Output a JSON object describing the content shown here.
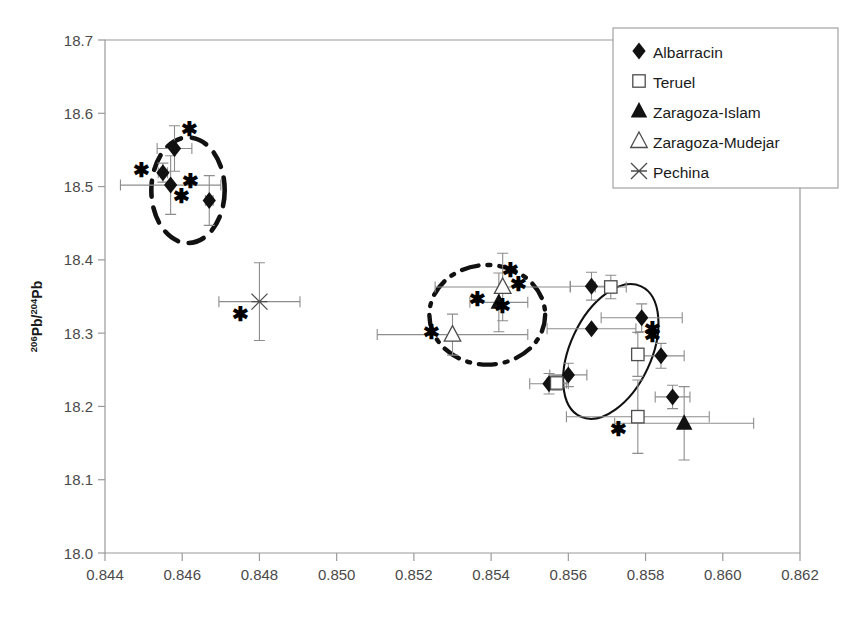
{
  "chart_data": {
    "type": "scatter",
    "title": "",
    "xlabel": "",
    "ylabel": "206Pb/204Pb",
    "ylabel_parts": {
      "sup1": "206",
      "mid": "Pb/",
      "sup2": "204",
      "tail": "Pb"
    },
    "xlim": [
      0.844,
      0.862
    ],
    "ylim": [
      18.0,
      18.7
    ],
    "xticks": [
      "0.844",
      "0.846",
      "0.848",
      "0.850",
      "0.852",
      "0.854",
      "0.856",
      "0.858",
      "0.860",
      "0.862"
    ],
    "xtick_values": [
      0.844,
      0.846,
      0.848,
      0.85,
      0.852,
      0.854,
      0.856,
      0.858,
      0.86,
      0.862
    ],
    "yticks": [
      "18.0",
      "18.1",
      "18.2",
      "18.3",
      "18.4",
      "18.5",
      "18.6",
      "18.7"
    ],
    "ytick_values": [
      18.0,
      18.1,
      18.2,
      18.3,
      18.4,
      18.5,
      18.6,
      18.7
    ],
    "grid": false,
    "legend_position": "top-right",
    "legend": [
      {
        "label": "Albarracin",
        "marker": "filled-diamond"
      },
      {
        "label": "Teruel",
        "marker": "open-square"
      },
      {
        "label": "Zaragoza-Islam",
        "marker": "filled-triangle"
      },
      {
        "label": "Zaragoza-Mudejar",
        "marker": "open-triangle"
      },
      {
        "label": "Pechina",
        "marker": "x-cross"
      }
    ],
    "series": [
      {
        "name": "Albarracin",
        "marker": "filled-diamond",
        "points": [
          {
            "x": 0.8458,
            "y": 18.552,
            "xerr": 0.00045,
            "yerr": 0.031,
            "star": "upper-right"
          },
          {
            "x": 0.8455,
            "y": 18.519,
            "xerr": 0.00012,
            "yerr": 0.013,
            "star": "left"
          },
          {
            "x": 0.8457,
            "y": 18.502,
            "xerr": 0.0013,
            "yerr": 0.04,
            "star": "lower-right"
          },
          {
            "x": 0.8467,
            "y": 18.481,
            "xerr": 0.0001,
            "yerr": 0.034,
            "star": "upper-left"
          },
          {
            "x": 0.8566,
            "y": 18.364,
            "xerr": 0.00055,
            "yerr": 0.019,
            "star": "none"
          },
          {
            "x": 0.8579,
            "y": 18.321,
            "xerr": 0.00105,
            "yerr": 0.019,
            "star": "lower-right"
          },
          {
            "x": 0.8566,
            "y": 18.306,
            "xerr": 0.00115,
            "yerr": 0.0,
            "star": "none"
          },
          {
            "x": 0.856,
            "y": 18.243,
            "xerr": 0.00048,
            "yerr": 0.016,
            "star": "none"
          },
          {
            "x": 0.8555,
            "y": 18.231,
            "xerr": 0.0005,
            "yerr": 0.014,
            "star": "none"
          },
          {
            "x": 0.8584,
            "y": 18.269,
            "xerr": 0.0006,
            "yerr": 0.017,
            "star": "none"
          },
          {
            "x": 0.8587,
            "y": 18.213,
            "xerr": 0.00045,
            "yerr": 0.016,
            "star": "none"
          }
        ]
      },
      {
        "name": "Teruel",
        "marker": "open-square",
        "points": [
          {
            "x": 0.8571,
            "y": 18.363,
            "xerr": 0.0004,
            "yerr": 0.016,
            "star": "none"
          },
          {
            "x": 0.8578,
            "y": 18.271,
            "xerr": 0.00012,
            "yerr": 0.03,
            "star": "upper-right"
          },
          {
            "x": 0.8557,
            "y": 18.232,
            "xerr": 0.00025,
            "yerr": 0.01,
            "star": "none"
          },
          {
            "x": 0.8578,
            "y": 18.186,
            "xerr": 0.00185,
            "yerr": 0.05,
            "star": "lower-left"
          }
        ]
      },
      {
        "name": "Zaragoza-Islam",
        "marker": "filled-triangle",
        "points": [
          {
            "x": 0.8542,
            "y": 18.342,
            "xerr": 0.00075,
            "yerr": 0.04,
            "star": "left"
          },
          {
            "x": 0.859,
            "y": 18.177,
            "xerr": 0.0018,
            "yerr": 0.05,
            "star": "none"
          }
        ]
      },
      {
        "name": "Zaragoza-Mudejar",
        "marker": "open-triangle",
        "points": [
          {
            "x": 0.8543,
            "y": 18.363,
            "xerr": 0.00175,
            "yerr": 0.046,
            "star": "right"
          },
          {
            "x": 0.853,
            "y": 18.298,
            "xerr": 0.00195,
            "yerr": 0.028,
            "star": "left"
          }
        ]
      },
      {
        "name": "Pechina",
        "marker": "x-cross",
        "points": [
          {
            "x": 0.848,
            "y": 18.343,
            "xerr": 0.00105,
            "yerr": 0.053,
            "star": "lower-left"
          }
        ]
      }
    ],
    "extra_stars": [
      {
        "x": 0.8545,
        "y": 18.385
      },
      {
        "x": 0.8543,
        "y": 18.336
      }
    ],
    "ellipses": [
      {
        "name": "albarracin-group",
        "style": "dashed",
        "cx": 0.84615,
        "cy": 18.495,
        "rx": 0.00095,
        "ry": 0.072,
        "rotation": 0
      },
      {
        "name": "zaragoza-group",
        "style": "dash-dot",
        "cx": 0.8539,
        "cy": 18.325,
        "rx": 0.0015,
        "ry": 0.068,
        "rotation": 0
      },
      {
        "name": "teruel-albarracin-group",
        "style": "solid",
        "cx": 0.8571,
        "cy": 18.275,
        "rx": 0.00105,
        "ry": 0.098,
        "rotation": 25
      }
    ]
  },
  "colors": {
    "marker": "#111111",
    "axis": "#9a9a9a",
    "errorbar": "#8d8d8d",
    "text": "#1a1a1a",
    "background": "#ffffff"
  }
}
